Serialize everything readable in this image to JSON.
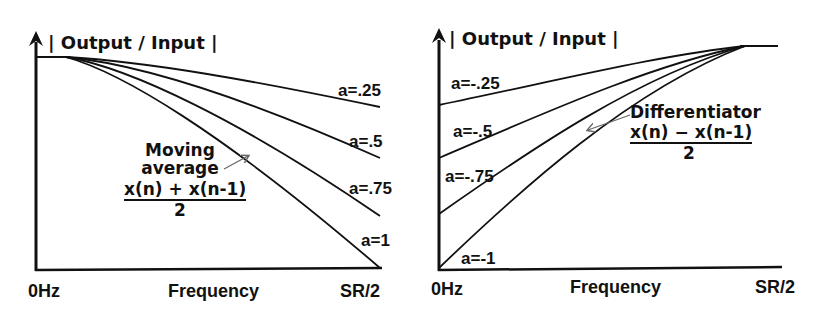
{
  "left_chart": {
    "y_label": "| Output / Input |",
    "x_label": "Frequency",
    "x_start": "0Hz",
    "x_end": "SR/2",
    "annotation": {
      "line1": "Moving",
      "line2": "average",
      "numerator": "x(n) + x(n-1)",
      "denominator": "2"
    },
    "curves": [
      {
        "label": "a=.25"
      },
      {
        "label": "a=.5"
      },
      {
        "label": "a=.75"
      },
      {
        "label": "a=1"
      }
    ]
  },
  "right_chart": {
    "y_label": "| Output / Input |",
    "x_label": "Frequency",
    "x_start": "0Hz",
    "x_end": "SR/2",
    "annotation": {
      "line1": "Differentiator",
      "numerator": "x(n) − x(n-1)",
      "denominator": "2"
    },
    "curves": [
      {
        "label": "a=-.25"
      },
      {
        "label": "a=-.5"
      },
      {
        "label": "a=-.75"
      },
      {
        "label": "a=-1"
      }
    ]
  },
  "colors": {
    "ink": "#111111",
    "background": "#ffffff",
    "arrow": "#666666"
  }
}
